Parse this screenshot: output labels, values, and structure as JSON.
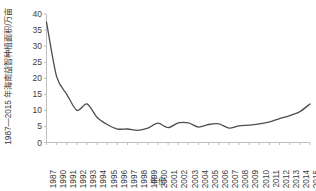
{
  "chart_data": {
    "type": "line",
    "title": "",
    "ylabel": "1987—2015 年海南益智种植面积/万亩",
    "xlabel": "年份",
    "ylim": [
      0,
      40
    ],
    "yticks": [
      0,
      5,
      10,
      15,
      20,
      25,
      30,
      35,
      40
    ],
    "grid": false,
    "legend": "none",
    "series_name": "海南益智种植面积",
    "line_color": "#4d4d4d",
    "axis_color": "#bfbfbf",
    "text_color": "#3d3d3d",
    "categories": [
      "1987",
      "1990",
      "1991",
      "1992",
      "1993",
      "1994",
      "1995",
      "1996",
      "1997",
      "1998",
      "1999",
      "2000",
      "2001",
      "2002",
      "2003",
      "2004",
      "2005",
      "2006",
      "2007",
      "2008",
      "2009",
      "2010",
      "2011",
      "2012",
      "2013",
      "2014",
      "2015"
    ],
    "values": [
      37.5,
      20.5,
      15.0,
      10.0,
      12.0,
      7.8,
      5.6,
      4.2,
      4.2,
      3.8,
      4.5,
      6.0,
      4.6,
      6.1,
      6.1,
      4.8,
      5.6,
      5.8,
      4.5,
      5.2,
      5.4,
      5.8,
      6.4,
      7.4,
      8.4,
      9.6,
      12.0
    ],
    "units": "万亩"
  },
  "xticks": [
    "1987",
    "1990",
    "1991",
    "1992",
    "1993",
    "1994",
    "1995",
    "1996",
    "1997",
    "1998",
    "1999",
    "2000",
    "2001",
    "2002",
    "2003",
    "2004",
    "2005",
    "2006",
    "2007",
    "2008",
    "2009",
    "2010",
    "2011",
    "2012",
    "2013",
    "2014",
    "2015"
  ]
}
